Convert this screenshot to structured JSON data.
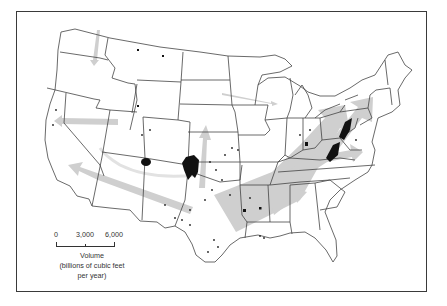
{
  "figure": {
    "type": "map",
    "colors": {
      "frame": "#3a3a3a",
      "state_lines": "#555555",
      "flow_arrows": "#cfcfcf",
      "production_areas": "#111111",
      "background": "#ffffff"
    }
  },
  "legend": {
    "scale_ticks": [
      "0",
      "3,000",
      "6,000"
    ],
    "title": "Volume",
    "units_line1": "(billions of cubic feet",
    "units_line2": "per year)"
  },
  "flows": [
    {
      "name": "gulf-to-northeast",
      "direction": "southwest-to-northeast",
      "relative_width": "widest"
    },
    {
      "name": "appalachia-to-northeast",
      "direction": "southwest-to-northeast",
      "relative_width": "wide"
    },
    {
      "name": "texas-to-california",
      "direction": "east-to-west",
      "relative_width": "medium"
    },
    {
      "name": "kansas-north",
      "direction": "south-to-north",
      "relative_width": "medium"
    },
    {
      "name": "nevada-west",
      "direction": "east-to-west",
      "relative_width": "medium"
    },
    {
      "name": "louisiana-to-southeast",
      "direction": "west-to-east",
      "relative_width": "medium"
    },
    {
      "name": "virginia-east",
      "direction": "west-to-east",
      "relative_width": "small"
    },
    {
      "name": "washington-south",
      "direction": "north-to-south",
      "relative_width": "small"
    },
    {
      "name": "dakota-to-great-lakes",
      "direction": "west-to-east",
      "relative_width": "thin"
    }
  ]
}
